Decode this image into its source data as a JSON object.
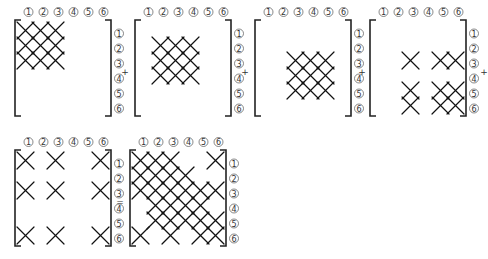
{
  "labels": [
    "1",
    "2",
    "3",
    "4",
    "5",
    "6"
  ],
  "operators": [
    "+",
    "+",
    "+",
    "+",
    "="
  ],
  "matrices": [
    {
      "name": "matrix-1",
      "x": 15,
      "y": 20,
      "cells": [
        [
          1,
          1
        ],
        [
          1,
          2
        ],
        [
          1,
          3
        ],
        [
          2,
          1
        ],
        [
          2,
          2
        ],
        [
          2,
          3
        ],
        [
          3,
          1
        ],
        [
          3,
          2
        ],
        [
          3,
          3
        ]
      ]
    },
    {
      "name": "matrix-2",
      "x": 135,
      "y": 20,
      "cells": [
        [
          2,
          2
        ],
        [
          2,
          3
        ],
        [
          2,
          4
        ],
        [
          3,
          2
        ],
        [
          3,
          3
        ],
        [
          3,
          4
        ],
        [
          4,
          2
        ],
        [
          4,
          3
        ],
        [
          4,
          4
        ]
      ]
    },
    {
      "name": "matrix-3",
      "x": 255,
      "y": 20,
      "cells": [
        [
          3,
          3
        ],
        [
          3,
          4
        ],
        [
          3,
          5
        ],
        [
          4,
          3
        ],
        [
          4,
          4
        ],
        [
          4,
          5
        ],
        [
          5,
          3
        ],
        [
          5,
          4
        ],
        [
          5,
          5
        ]
      ]
    },
    {
      "name": "matrix-4",
      "x": 370,
      "y": 20,
      "cells": [
        [
          3,
          3
        ],
        [
          3,
          5
        ],
        [
          3,
          6
        ],
        [
          5,
          3
        ],
        [
          5,
          5
        ],
        [
          5,
          6
        ],
        [
          6,
          3
        ],
        [
          6,
          5
        ],
        [
          6,
          6
        ]
      ]
    },
    {
      "name": "matrix-5",
      "x": 15,
      "y": 150,
      "cells": [
        [
          1,
          1
        ],
        [
          1,
          3
        ],
        [
          1,
          6
        ],
        [
          3,
          1
        ],
        [
          3,
          3
        ],
        [
          3,
          6
        ],
        [
          6,
          1
        ],
        [
          6,
          3
        ],
        [
          6,
          6
        ]
      ]
    },
    {
      "name": "matrix-sum",
      "x": 130,
      "y": 150,
      "cells": [
        [
          1,
          1
        ],
        [
          1,
          2
        ],
        [
          1,
          3
        ],
        [
          1,
          6
        ],
        [
          2,
          1
        ],
        [
          2,
          2
        ],
        [
          2,
          3
        ],
        [
          2,
          4
        ],
        [
          3,
          1
        ],
        [
          3,
          2
        ],
        [
          3,
          3
        ],
        [
          3,
          4
        ],
        [
          3,
          5
        ],
        [
          3,
          6
        ],
        [
          4,
          2
        ],
        [
          4,
          3
        ],
        [
          4,
          4
        ],
        [
          4,
          5
        ],
        [
          5,
          2
        ],
        [
          5,
          3
        ],
        [
          5,
          4
        ],
        [
          5,
          5
        ],
        [
          5,
          6
        ],
        [
          6,
          1
        ],
        [
          6,
          3
        ],
        [
          6,
          5
        ],
        [
          6,
          6
        ]
      ]
    }
  ]
}
